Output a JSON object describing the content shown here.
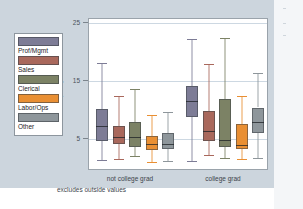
{
  "figure": {
    "background_color": "#ccd5dd",
    "plot_background": "#ffffff",
    "footnote": "excludes outside values",
    "axis_title_y": "hourly wage"
  },
  "legend": {
    "items": [
      {
        "label": "Prof/Mgmt",
        "color": "#7d7c96"
      },
      {
        "label": "Sales",
        "color": "#a9685c"
      },
      {
        "label": "Clerical",
        "color": "#7c8265"
      },
      {
        "label": "Labor/Ops",
        "color": "#e98f33"
      },
      {
        "label": "Other",
        "color": "#8e969b"
      }
    ]
  },
  "chart_data": {
    "type": "box",
    "title": "",
    "xlabel": "",
    "ylabel": "hourly wage",
    "ylim": [
      0,
      27
    ],
    "yticks": [
      5,
      15,
      25
    ],
    "ytick_labels": [
      "5",
      "15",
      "25"
    ],
    "grid": true,
    "legend_position": "left-outside",
    "annotations": [
      "excludes outside values"
    ],
    "groups": [
      "not college grad",
      "college grad"
    ],
    "series": [
      {
        "name": "Prof/Mgmt",
        "color": "#7d7c96",
        "boxes": [
          {
            "group": "not college grad",
            "whisker_low": 1.7,
            "q1": 5.2,
            "median": 7.8,
            "q3": 10.8,
            "whisker_high": 19.0
          },
          {
            "group": "college grad",
            "whisker_low": 1.6,
            "q1": 9.5,
            "median": 12.3,
            "q3": 14.9,
            "whisker_high": 23.3
          }
        ]
      },
      {
        "name": "Sales",
        "color": "#a9685c",
        "boxes": [
          {
            "group": "not college grad",
            "whisker_low": 1.9,
            "q1": 4.6,
            "median": 5.8,
            "q3": 7.9,
            "whisker_high": 13.2
          },
          {
            "group": "college grad",
            "whisker_low": 2.7,
            "q1": 5.2,
            "median": 7.0,
            "q3": 10.5,
            "whisker_high": 18.9
          }
        ]
      },
      {
        "name": "Clerical",
        "color": "#7c8265",
        "boxes": [
          {
            "group": "not college grad",
            "whisker_low": 2.4,
            "q1": 4.1,
            "median": 5.9,
            "q3": 8.5,
            "whisker_high": 14.4
          },
          {
            "group": "college grad",
            "whisker_low": 2.2,
            "q1": 4.0,
            "median": 5.4,
            "q3": 12.7,
            "whisker_high": 23.5
          }
        ]
      },
      {
        "name": "Labor/Ops",
        "color": "#e98f33",
        "boxes": [
          {
            "group": "not college grad",
            "whisker_low": 1.5,
            "q1": 3.6,
            "median": 4.6,
            "q3": 6.1,
            "whisker_high": 9.8
          },
          {
            "group": "college grad",
            "whisker_low": 2.0,
            "q1": 3.7,
            "median": 4.5,
            "q3": 8.1,
            "whisker_high": 13.2
          }
        ]
      },
      {
        "name": "Other",
        "color": "#8e969b",
        "boxes": [
          {
            "group": "not college grad",
            "whisker_low": 1.6,
            "q1": 3.7,
            "median": 4.7,
            "q3": 6.6,
            "whisker_high": 10.3
          },
          {
            "group": "college grad",
            "whisker_low": 2.2,
            "q1": 6.6,
            "median": 8.5,
            "q3": 11.1,
            "whisker_high": 17.2
          }
        ]
      }
    ]
  }
}
